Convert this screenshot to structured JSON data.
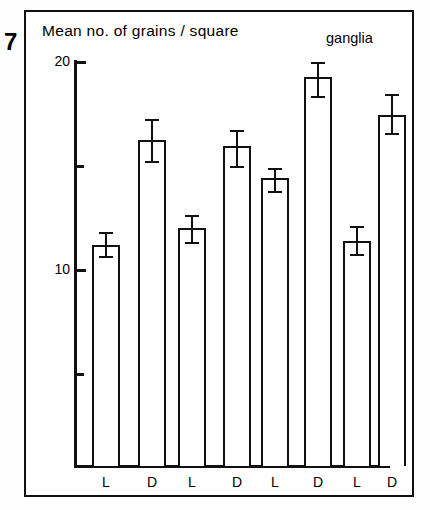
{
  "figure": {
    "number": "7",
    "y_axis_title": "Mean no. of grains / square",
    "right_title": "ganglia"
  },
  "chart_data": {
    "type": "bar",
    "title": "Mean no. of grains / square",
    "subtitle": "ganglia",
    "figure_label": "7",
    "xlabel": "",
    "ylabel": "Mean no. of grains / square",
    "ylim": [
      0.6,
      20.6
    ],
    "yticks": [
      10,
      20
    ],
    "ytick_labels": [
      "10",
      "20"
    ],
    "minor_yticks": [
      5,
      15
    ],
    "grid": false,
    "legend": null,
    "categories": [
      "L",
      "D",
      "L",
      "D",
      "L",
      "D",
      "L",
      "D"
    ],
    "groups": [
      {
        "name": "group-1",
        "bars": [
          {
            "label": "L",
            "value": 11.2
          },
          {
            "label": "D",
            "value": 16.25
          }
        ]
      },
      {
        "name": "group-2",
        "bars": [
          {
            "label": "L",
            "value": 12.0
          },
          {
            "label": "D",
            "value": 15.95
          }
        ]
      },
      {
        "name": "group-3",
        "bars": [
          {
            "label": "L",
            "value": 14.4
          },
          {
            "label": "D",
            "value": 19.3
          }
        ]
      },
      {
        "name": "group-4",
        "bars": [
          {
            "label": "L",
            "value": 11.4
          },
          {
            "label": "D",
            "value": 17.45
          }
        ]
      }
    ],
    "values": [
      11.2,
      16.25,
      12.0,
      15.95,
      14.4,
      19.3,
      11.4,
      17.45
    ],
    "errors_upper": [
      0.65,
      1.0,
      0.65,
      0.8,
      0.5,
      0.7,
      0.7,
      1.0
    ],
    "errors_lower": [
      0.55,
      1.0,
      0.65,
      0.95,
      0.62,
      0.95,
      0.65,
      0.85
    ],
    "error_bars": [
      {
        "value": 11.2,
        "upper": 11.85,
        "lower": 10.65
      },
      {
        "value": 16.25,
        "upper": 17.25,
        "lower": 15.25
      },
      {
        "value": 12.0,
        "upper": 12.65,
        "lower": 11.35
      },
      {
        "value": 15.95,
        "upper": 16.75,
        "lower": 15.0
      },
      {
        "value": 14.4,
        "upper": 14.9,
        "lower": 13.78
      },
      {
        "value": 19.3,
        "upper": 20.0,
        "lower": 18.35
      },
      {
        "value": 11.4,
        "upper": 12.1,
        "lower": 10.75
      },
      {
        "value": 17.45,
        "upper": 18.45,
        "lower": 16.6
      }
    ]
  }
}
